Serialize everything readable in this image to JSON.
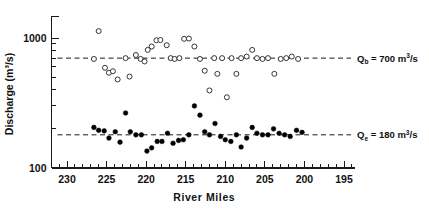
{
  "chart_data": {
    "type": "scatter",
    "title": "",
    "xlabel": "River Miles",
    "ylabel": "Discharge (m³/s)",
    "yscale": "log",
    "ylim": [
      100,
      2000
    ],
    "xlim": [
      232,
      194
    ],
    "x_reversed": true,
    "grid": false,
    "y_tick_labels": [
      "1000",
      "100"
    ],
    "y_tick_values": [
      1000,
      100
    ],
    "x_tick_labels": [
      "230",
      "225",
      "220",
      "215",
      "210",
      "205",
      "200",
      "195"
    ],
    "x_tick_values": [
      230,
      225,
      220,
      215,
      210,
      205,
      200,
      195
    ],
    "x_minor_tick_step": 1,
    "annotations": [
      {
        "name": "bankfull-discharge-label",
        "symbol": "Q",
        "subscript": "b",
        "equals": " = ",
        "value": "700",
        "units_main": "m",
        "units_sup": "3",
        "units_tail": "/s",
        "full_text": "Qb = 700 m3/s",
        "y_value": 700
      },
      {
        "name": "effective-discharge-label",
        "symbol": "Q",
        "subscript": "e",
        "equals": " = ",
        "value": "180",
        "units_main": "m",
        "units_sup": "3",
        "units_tail": "/s",
        "full_text": "Qe = 180 m3/s",
        "y_value": 180
      }
    ],
    "reference_lines": [
      {
        "name": "bankfull-reference-line",
        "y": 700,
        "style": "dashed"
      },
      {
        "name": "effective-reference-line",
        "y": 180,
        "style": "dashed"
      }
    ],
    "series": [
      {
        "name": "Bankfull discharge",
        "marker": "open-circle",
        "color": "#2b2b2b",
        "points": [
          [
            226.6,
            690
          ],
          [
            226.0,
            1130
          ],
          [
            225.2,
            590
          ],
          [
            224.7,
            540
          ],
          [
            224.2,
            555
          ],
          [
            223.6,
            480
          ],
          [
            222.6,
            700
          ],
          [
            222.1,
            505
          ],
          [
            221.3,
            740
          ],
          [
            220.7,
            690
          ],
          [
            220.2,
            660
          ],
          [
            219.8,
            810
          ],
          [
            219.3,
            860
          ],
          [
            218.7,
            960
          ],
          [
            218.2,
            965
          ],
          [
            217.4,
            880
          ],
          [
            216.9,
            700
          ],
          [
            216.4,
            690
          ],
          [
            215.8,
            700
          ],
          [
            215.2,
            985
          ],
          [
            214.6,
            990
          ],
          [
            213.9,
            860
          ],
          [
            213.2,
            690
          ],
          [
            212.6,
            560
          ],
          [
            212.0,
            395
          ],
          [
            211.4,
            700
          ],
          [
            211.0,
            530
          ],
          [
            210.4,
            700
          ],
          [
            209.8,
            350
          ],
          [
            209.2,
            700
          ],
          [
            208.6,
            530
          ],
          [
            208.0,
            700
          ],
          [
            207.3,
            720
          ],
          [
            206.6,
            810
          ],
          [
            206.0,
            700
          ],
          [
            205.3,
            690
          ],
          [
            204.6,
            700
          ],
          [
            203.8,
            530
          ],
          [
            203.0,
            690
          ],
          [
            202.3,
            700
          ],
          [
            201.6,
            720
          ],
          [
            200.8,
            690
          ]
        ]
      },
      {
        "name": "Effective discharge",
        "marker": "filled-circle",
        "color": "#000000",
        "points": [
          [
            226.6,
            205
          ],
          [
            226.0,
            195
          ],
          [
            225.3,
            193
          ],
          [
            224.7,
            170
          ],
          [
            223.9,
            190
          ],
          [
            223.3,
            158
          ],
          [
            222.6,
            265
          ],
          [
            222.0,
            190
          ],
          [
            221.3,
            180
          ],
          [
            220.6,
            180
          ],
          [
            219.9,
            135
          ],
          [
            219.3,
            143
          ],
          [
            218.6,
            160
          ],
          [
            218.0,
            160
          ],
          [
            217.3,
            185
          ],
          [
            216.6,
            155
          ],
          [
            215.9,
            163
          ],
          [
            215.3,
            165
          ],
          [
            214.6,
            180
          ],
          [
            213.9,
            300
          ],
          [
            213.2,
            255
          ],
          [
            212.6,
            190
          ],
          [
            212.0,
            180
          ],
          [
            211.3,
            220
          ],
          [
            210.6,
            175
          ],
          [
            210.0,
            165
          ],
          [
            209.3,
            160
          ],
          [
            208.6,
            180
          ],
          [
            208.0,
            145
          ],
          [
            207.3,
            170
          ],
          [
            206.6,
            205
          ],
          [
            206.0,
            185
          ],
          [
            205.3,
            180
          ],
          [
            204.6,
            180
          ],
          [
            203.9,
            200
          ],
          [
            203.2,
            185
          ],
          [
            202.5,
            180
          ],
          [
            201.8,
            175
          ],
          [
            201.0,
            195
          ],
          [
            200.3,
            188
          ]
        ]
      }
    ]
  }
}
